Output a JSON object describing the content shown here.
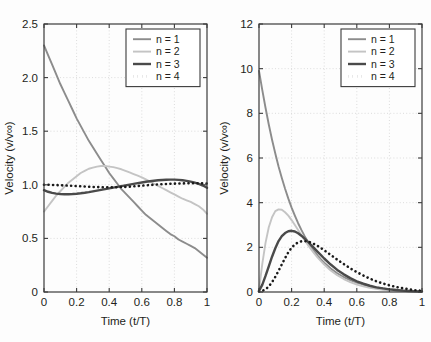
{
  "figure": {
    "background_color": "#fdfdfd",
    "axis_color": "#3b3b3b",
    "grid_color": "#cfcfcf",
    "text_color": "#231f20"
  },
  "series_style": {
    "n1": {
      "color": "#8c8c8c",
      "width": 1.9,
      "dash": "none"
    },
    "n2": {
      "color": "#c4c4c4",
      "width": 1.9,
      "dash": "none"
    },
    "n3": {
      "color": "#4a4a4a",
      "width": 2.4,
      "dash": "none"
    },
    "n4": {
      "color": "#1a1a1a",
      "width": 2.6,
      "dash": "dotted"
    }
  },
  "chart_data": [
    {
      "id": "left",
      "type": "line",
      "title": "",
      "xlabel": "Time (t/T)",
      "ylabel": "Velocity (v/v∞)",
      "xlim": [
        0,
        1
      ],
      "ylim": [
        0,
        2.5
      ],
      "xticks": [
        0,
        0.2,
        0.4,
        0.6,
        0.8,
        1
      ],
      "xticklabels": [
        "0",
        "0.2",
        "0.4",
        "0.6",
        "0.8",
        "1"
      ],
      "yticks": [
        0,
        0.5,
        1.0,
        1.5,
        2.0,
        2.5
      ],
      "yticklabels": [
        "0",
        "0.5",
        "1.0",
        "1.5",
        "2.0",
        "2.5"
      ],
      "grid": true,
      "legend_position": "top-right",
      "x": [
        0,
        0.025,
        0.05,
        0.075,
        0.1,
        0.125,
        0.15,
        0.175,
        0.2,
        0.225,
        0.25,
        0.275,
        0.3,
        0.325,
        0.35,
        0.375,
        0.4,
        0.425,
        0.45,
        0.475,
        0.5,
        0.525,
        0.55,
        0.575,
        0.6,
        0.625,
        0.65,
        0.675,
        0.7,
        0.725,
        0.75,
        0.775,
        0.8,
        0.825,
        0.85,
        0.875,
        0.9,
        0.925,
        0.95,
        0.975,
        1
      ],
      "series": [
        {
          "name": "n = 1",
          "style": "n1",
          "values": [
            2.3,
            2.21,
            2.12,
            2.03,
            1.94,
            1.86,
            1.78,
            1.7,
            1.62,
            1.55,
            1.48,
            1.41,
            1.35,
            1.29,
            1.23,
            1.17,
            1.11,
            1.06,
            1.01,
            0.96,
            0.92,
            0.88,
            0.84,
            0.8,
            0.76,
            0.72,
            0.69,
            0.66,
            0.63,
            0.6,
            0.57,
            0.54,
            0.52,
            0.49,
            0.47,
            0.45,
            0.43,
            0.41,
            0.38,
            0.35,
            0.32
          ]
        },
        {
          "name": "n = 2",
          "style": "n2",
          "values": [
            0.75,
            0.8,
            0.85,
            0.9,
            0.94,
            0.98,
            1.02,
            1.05,
            1.08,
            1.11,
            1.13,
            1.15,
            1.16,
            1.17,
            1.175,
            1.175,
            1.17,
            1.165,
            1.155,
            1.145,
            1.13,
            1.115,
            1.1,
            1.085,
            1.07,
            1.05,
            1.03,
            1.01,
            0.99,
            0.97,
            0.95,
            0.93,
            0.91,
            0.89,
            0.87,
            0.855,
            0.84,
            0.82,
            0.8,
            0.77,
            0.73
          ]
        },
        {
          "name": "n = 3",
          "style": "n3",
          "values": [
            0.95,
            0.935,
            0.925,
            0.918,
            0.914,
            0.912,
            0.912,
            0.914,
            0.917,
            0.921,
            0.926,
            0.932,
            0.939,
            0.946,
            0.953,
            0.96,
            0.967,
            0.974,
            0.981,
            0.988,
            0.995,
            1.002,
            1.009,
            1.016,
            1.022,
            1.028,
            1.033,
            1.038,
            1.042,
            1.045,
            1.047,
            1.048,
            1.048,
            1.046,
            1.042,
            1.037,
            1.03,
            1.021,
            1.009,
            0.993,
            0.972
          ]
        },
        {
          "name": "n = 4",
          "style": "n4",
          "values": [
            1.0,
            1.0,
            0.999,
            0.998,
            0.996,
            0.994,
            0.992,
            0.99,
            0.988,
            0.986,
            0.984,
            0.982,
            0.98,
            0.979,
            0.978,
            0.977,
            0.977,
            0.977,
            0.978,
            0.979,
            0.981,
            0.983,
            0.986,
            0.989,
            0.992,
            0.995,
            0.998,
            1.001,
            1.004,
            1.006,
            1.008,
            1.01,
            1.011,
            1.012,
            1.013,
            1.014,
            1.014,
            1.014,
            1.014,
            1.013,
            1.012
          ]
        }
      ]
    },
    {
      "id": "right",
      "type": "line",
      "title": "",
      "xlabel": "Time (t/T)",
      "ylabel": "Velocity (v/v∞)",
      "xlim": [
        0,
        1
      ],
      "ylim": [
        0,
        12
      ],
      "xticks": [
        0,
        0.2,
        0.4,
        0.6,
        0.8,
        1
      ],
      "xticklabels": [
        "0",
        "0.2",
        "0.4",
        "0.6",
        "0.8",
        "1"
      ],
      "yticks": [
        0,
        2,
        4,
        6,
        8,
        10,
        12
      ],
      "yticklabels": [
        "0",
        "2",
        "4",
        "6",
        "8",
        "10",
        "12"
      ],
      "grid": true,
      "legend_position": "top-right",
      "x": [
        0,
        0.02,
        0.04,
        0.06,
        0.08,
        0.1,
        0.12,
        0.14,
        0.16,
        0.18,
        0.2,
        0.22,
        0.24,
        0.26,
        0.28,
        0.3,
        0.32,
        0.34,
        0.36,
        0.38,
        0.4,
        0.44,
        0.48,
        0.52,
        0.56,
        0.6,
        0.64,
        0.68,
        0.72,
        0.76,
        0.8,
        0.84,
        0.88,
        0.92,
        0.96,
        1
      ],
      "series": [
        {
          "name": "n = 1",
          "style": "n1",
          "values": [
            9.9,
            9.05,
            8.25,
            7.5,
            6.82,
            6.2,
            5.62,
            5.1,
            4.62,
            4.18,
            3.78,
            3.42,
            3.08,
            2.78,
            2.5,
            2.25,
            2.02,
            1.82,
            1.63,
            1.46,
            1.31,
            1.05,
            0.84,
            0.67,
            0.53,
            0.42,
            0.33,
            0.26,
            0.2,
            0.16,
            0.12,
            0.09,
            0.07,
            0.05,
            0.04,
            0.03
          ]
        },
        {
          "name": "n = 2",
          "style": "n2",
          "values": [
            0.1,
            1.25,
            2.2,
            2.9,
            3.35,
            3.62,
            3.7,
            3.68,
            3.57,
            3.42,
            3.22,
            3.0,
            2.78,
            2.55,
            2.33,
            2.11,
            1.91,
            1.72,
            1.54,
            1.38,
            1.23,
            0.96,
            0.75,
            0.58,
            0.44,
            0.33,
            0.25,
            0.19,
            0.14,
            0.1,
            0.07,
            0.05,
            0.04,
            0.03,
            0.02,
            0.01
          ]
        },
        {
          "name": "n = 3",
          "style": "n3",
          "values": [
            0.05,
            0.32,
            0.72,
            1.15,
            1.58,
            1.96,
            2.28,
            2.5,
            2.64,
            2.72,
            2.74,
            2.71,
            2.63,
            2.52,
            2.39,
            2.25,
            2.1,
            1.95,
            1.8,
            1.65,
            1.5,
            1.23,
            0.99,
            0.79,
            0.62,
            0.48,
            0.37,
            0.28,
            0.21,
            0.16,
            0.12,
            0.09,
            0.06,
            0.045,
            0.03,
            0.02
          ]
        },
        {
          "name": "n = 4",
          "style": "n4",
          "values": [
            0.02,
            0.05,
            0.12,
            0.25,
            0.44,
            0.68,
            0.95,
            1.24,
            1.52,
            1.78,
            1.98,
            2.13,
            2.22,
            2.27,
            2.28,
            2.26,
            2.21,
            2.14,
            2.06,
            1.97,
            1.87,
            1.66,
            1.45,
            1.25,
            1.06,
            0.89,
            0.74,
            0.6,
            0.48,
            0.38,
            0.3,
            0.23,
            0.17,
            0.12,
            0.08,
            0.05
          ]
        }
      ]
    }
  ]
}
